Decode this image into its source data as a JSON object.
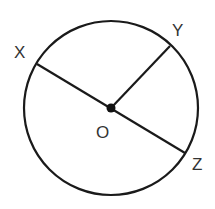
{
  "diagram": {
    "type": "circle-geometry",
    "circle": {
      "center": [
        111,
        108
      ],
      "radius": 87,
      "stroke": "#1a1a1a"
    },
    "center_point": {
      "label": "O",
      "x": 111,
      "y": 108
    },
    "points": [
      {
        "label": "X",
        "x": 37,
        "y": 64
      },
      {
        "label": "Y",
        "x": 170,
        "y": 46
      },
      {
        "label": "Z",
        "x": 185,
        "y": 153
      }
    ],
    "segments": [
      {
        "from": "X",
        "to": "Z",
        "description": "diameter XZ through O"
      },
      {
        "from": "O",
        "to": "Y",
        "description": "radius OY"
      }
    ],
    "labels": {
      "x": "X",
      "y": "Y",
      "o": "O",
      "z": "Z"
    }
  }
}
